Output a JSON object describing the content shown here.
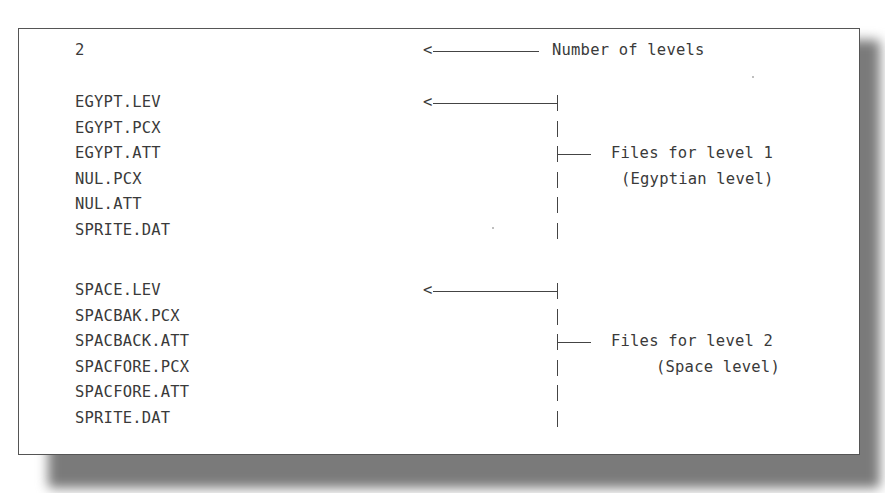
{
  "figure": {
    "level_count": "2",
    "level_count_label": "Number of levels",
    "groups": [
      {
        "files": [
          "EGYPT.LEV",
          "EGYPT.PCX",
          "EGYPT.ATT",
          "NUL.PCX",
          "NUL.ATT",
          "SPRITE.DAT"
        ],
        "label_line1": "Files for level 1",
        "label_line2": "(Egyptian level)"
      },
      {
        "files": [
          "SPACE.LEV",
          "SPACBAK.PCX",
          "SPACBACK.ATT",
          "SPACFORE.PCX",
          "SPACFORE.ATT",
          "SPRITE.DAT"
        ],
        "label_line1": "Files for level 2",
        "label_line2": "(Space level)"
      }
    ],
    "arrow_glyph": "<"
  }
}
